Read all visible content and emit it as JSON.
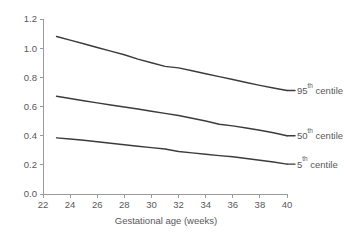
{
  "chart_data": {
    "type": "line",
    "title": "",
    "subtitle": "",
    "xlabel": "Gestational age (weeks)",
    "ylabel": "",
    "xlim": [
      22,
      40
    ],
    "ylim": [
      0.0,
      1.2
    ],
    "xticks": [
      22,
      24,
      26,
      28,
      30,
      32,
      34,
      36,
      38,
      40
    ],
    "yticks": [
      0.0,
      0.2,
      0.4,
      0.6,
      0.8,
      1.0,
      1.2
    ],
    "xtick_labels": [
      "22",
      "24",
      "26",
      "28",
      "30",
      "32",
      "34",
      "36",
      "38",
      "40"
    ],
    "ytick_labels": [
      "0.0",
      "0.2",
      "0.4",
      "0.6",
      "0.8",
      "1.0",
      "1.2"
    ],
    "grid": false,
    "legend_position": "right-inline-annotations",
    "x": [
      23,
      24,
      25,
      26,
      27,
      28,
      29,
      30,
      31,
      32,
      33,
      34,
      35,
      36,
      37,
      38,
      39,
      40
    ],
    "series": [
      {
        "name": "95th centile",
        "label_base": "95",
        "label_sup": "th",
        "label_suffix": " centile",
        "color": "#3b3b3f",
        "values": [
          1.08,
          1.055,
          1.03,
          1.005,
          0.98,
          0.955,
          0.925,
          0.9,
          0.875,
          0.865,
          0.845,
          0.825,
          0.805,
          0.785,
          0.765,
          0.745,
          0.727,
          0.71
        ]
      },
      {
        "name": "50th centile",
        "label_base": "50",
        "label_sup": "th",
        "label_suffix": " centile",
        "color": "#3b3b3f",
        "values": [
          0.67,
          0.655,
          0.64,
          0.625,
          0.61,
          0.597,
          0.583,
          0.568,
          0.553,
          0.538,
          0.52,
          0.5,
          0.478,
          0.467,
          0.452,
          0.437,
          0.42,
          0.4
        ]
      },
      {
        "name": "5th centile",
        "label_base": "5",
        "label_sup": "th",
        "label_suffix": " centile",
        "color": "#3b3b3f",
        "values": [
          0.385,
          0.377,
          0.368,
          0.358,
          0.348,
          0.338,
          0.328,
          0.318,
          0.308,
          0.292,
          0.282,
          0.272,
          0.263,
          0.255,
          0.243,
          0.232,
          0.219,
          0.205
        ]
      }
    ]
  },
  "axes": {
    "x_title": "Gestational age (weeks)"
  }
}
